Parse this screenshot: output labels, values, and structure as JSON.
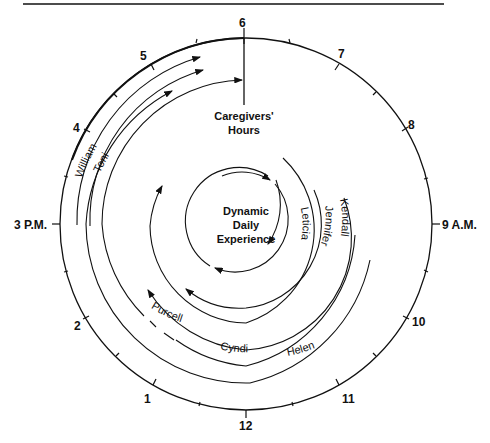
{
  "diagram": {
    "hours": {
      "h6": "6",
      "h7": "7",
      "h8": "8",
      "h9": "9  A.M.",
      "h10": "10",
      "h11": "11",
      "h12": "12",
      "h1": "1",
      "h2": "2",
      "h3": "3  P.M.",
      "h4": "4",
      "h5": "5"
    },
    "title": {
      "line1": "Caregivers'",
      "line2": "Hours"
    },
    "center": {
      "line1": "Dynamic",
      "line2": "Daily",
      "line3": "Experience"
    },
    "caregivers": {
      "william": "William",
      "toni": "Toni",
      "leticia": "Leticia",
      "jennifer": "Jennifer",
      "kendall": "Kendall",
      "purcell": "Purcell",
      "cyndi": "Cyndi",
      "helen": "Helen"
    },
    "colors": {
      "line": "#111111",
      "background": "#ffffff"
    }
  }
}
